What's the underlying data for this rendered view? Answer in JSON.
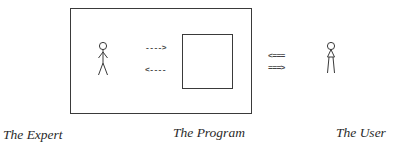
{
  "diagram": {
    "type": "block-diagram",
    "nodes": [
      {
        "id": "expert",
        "label": "The Expert",
        "icon": "stick-figure-icon",
        "inside_frame": true
      },
      {
        "id": "program",
        "label": "The Program",
        "icon": "square-box-icon",
        "inside_frame": true
      },
      {
        "id": "user",
        "label": "The User",
        "icon": "stick-figure-icon",
        "inside_frame": false
      }
    ],
    "edges": [
      {
        "from": "expert",
        "to": "program",
        "glyph": "---->",
        "style": "dashed"
      },
      {
        "from": "program",
        "to": "expert",
        "glyph": "<----",
        "style": "dashed"
      },
      {
        "from": "user",
        "to": "program",
        "glyph": "<===",
        "style": "double"
      },
      {
        "from": "program",
        "to": "user",
        "glyph": "===>",
        "style": "double"
      }
    ]
  },
  "arrows": {
    "expert_to_program": "---->",
    "program_to_expert": "<----",
    "user_to_program": "<===",
    "program_to_user": "===>"
  },
  "labels": {
    "expert": "The Expert",
    "program": "The Program",
    "user": "The User"
  },
  "colors": {
    "line": "#3a3a3a",
    "text": "#2a2a2a",
    "background": "#ffffff"
  }
}
